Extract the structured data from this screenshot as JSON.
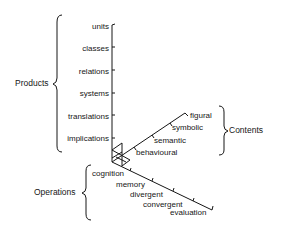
{
  "diagram": {
    "axes": {
      "products": {
        "title": "Products",
        "items": [
          "units",
          "classes",
          "relations",
          "systems",
          "translations",
          "implications"
        ]
      },
      "contents": {
        "title": "Contents",
        "items": [
          "figural",
          "symbolic",
          "semantic",
          "behavioural"
        ]
      },
      "operations": {
        "title": "Operations",
        "items": [
          "cognition",
          "memory",
          "divergent",
          "convergent",
          "evaluation"
        ]
      }
    },
    "colors": {
      "ink": "#161616",
      "background": "#ffffff"
    }
  }
}
